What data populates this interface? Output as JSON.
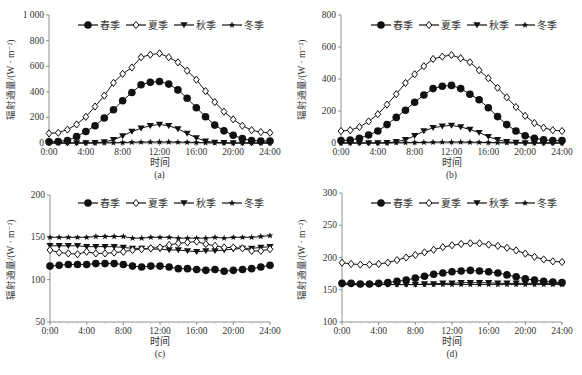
{
  "chart_data": [
    {
      "id": "a",
      "type": "line",
      "panel_label": "(a)",
      "xlabel": "时间",
      "ylabel": "辐射通量/(W · m⁻²)",
      "ylim": [
        0,
        1000
      ],
      "yticks": [
        0,
        200,
        400,
        600,
        800,
        1000
      ],
      "ytick_labels": [
        "0",
        "200",
        "400",
        "600",
        "800",
        "1 000"
      ],
      "xticks": [
        "0:00",
        "4:00",
        "8:00",
        "12:00",
        "16:00",
        "20:00",
        "24:00"
      ],
      "x_hours": [
        0,
        1,
        2,
        3,
        4,
        5,
        6,
        7,
        8,
        9,
        10,
        11,
        12,
        13,
        14,
        15,
        16,
        17,
        18,
        19,
        20,
        21,
        22,
        23,
        24
      ],
      "grid": false,
      "legend_position": "top",
      "series": [
        {
          "name": "春季",
          "marker": "filled-circle",
          "values": [
            10,
            12,
            20,
            50,
            90,
            135,
            195,
            260,
            330,
            395,
            455,
            475,
            480,
            460,
            415,
            350,
            275,
            205,
            140,
            95,
            60,
            35,
            20,
            15,
            15
          ]
        },
        {
          "name": "夏季",
          "marker": "open-diamond",
          "values": [
            75,
            80,
            105,
            145,
            205,
            285,
            370,
            470,
            540,
            590,
            670,
            690,
            700,
            670,
            630,
            565,
            495,
            405,
            320,
            245,
            185,
            135,
            100,
            85,
            80
          ]
        },
        {
          "name": "秋季",
          "marker": "filled-triangle-down",
          "values": [
            0,
            0,
            0,
            0,
            0,
            2,
            8,
            25,
            55,
            90,
            115,
            135,
            145,
            135,
            110,
            75,
            40,
            15,
            5,
            2,
            0,
            0,
            0,
            0,
            0
          ]
        },
        {
          "name": "冬季",
          "marker": "star",
          "values": [
            0,
            0,
            0,
            0,
            0,
            0,
            1,
            2,
            4,
            6,
            7,
            8,
            8,
            8,
            7,
            6,
            4,
            2,
            1,
            0,
            0,
            0,
            0,
            0,
            0
          ]
        }
      ]
    },
    {
      "id": "b",
      "type": "line",
      "panel_label": "(b)",
      "xlabel": "时间",
      "ylabel": "辐射通量/(W · m⁻²)",
      "ylim": [
        0,
        800
      ],
      "yticks": [
        0,
        200,
        400,
        600,
        800
      ],
      "ytick_labels": [
        "0",
        "200",
        "400",
        "600",
        "800"
      ],
      "xticks": [
        "0:00",
        "4:00",
        "8:00",
        "12:00",
        "16:00",
        "20:00",
        "24:00"
      ],
      "x_hours": [
        0,
        1,
        2,
        3,
        4,
        5,
        6,
        7,
        8,
        9,
        10,
        11,
        12,
        13,
        14,
        15,
        16,
        17,
        18,
        19,
        20,
        21,
        22,
        23,
        24
      ],
      "grid": false,
      "legend_position": "top",
      "series": [
        {
          "name": "春季",
          "marker": "filled-circle",
          "values": [
            15,
            18,
            30,
            50,
            75,
            115,
            160,
            205,
            255,
            300,
            340,
            355,
            360,
            340,
            305,
            270,
            220,
            165,
            115,
            75,
            45,
            30,
            20,
            15,
            15
          ]
        },
        {
          "name": "夏季",
          "marker": "open-diamond",
          "values": [
            75,
            80,
            100,
            135,
            180,
            240,
            305,
            375,
            430,
            480,
            525,
            540,
            550,
            530,
            505,
            455,
            405,
            345,
            285,
            225,
            170,
            125,
            95,
            80,
            75
          ]
        },
        {
          "name": "秋季",
          "marker": "filled-triangle-down",
          "values": [
            0,
            0,
            0,
            0,
            0,
            2,
            8,
            20,
            45,
            75,
            95,
            105,
            110,
            100,
            85,
            65,
            40,
            20,
            8,
            3,
            0,
            0,
            0,
            0,
            0
          ]
        },
        {
          "name": "冬季",
          "marker": "star",
          "values": [
            0,
            0,
            0,
            0,
            0,
            0,
            1,
            2,
            3,
            4,
            5,
            6,
            6,
            6,
            5,
            4,
            3,
            2,
            1,
            0,
            0,
            0,
            0,
            0,
            0
          ]
        }
      ]
    },
    {
      "id": "c",
      "type": "line",
      "panel_label": "(c)",
      "xlabel": "时间",
      "ylabel": "辐射通量/(W · m⁻²)",
      "ylim": [
        50,
        200
      ],
      "yticks": [
        50,
        100,
        150,
        200
      ],
      "ytick_labels": [
        "50",
        "100",
        "150",
        "200"
      ],
      "xticks": [
        "0:00",
        "4:00",
        "8:00",
        "12:00",
        "16:00",
        "20:00",
        "24:00"
      ],
      "x_hours": [
        0,
        1,
        2,
        3,
        4,
        5,
        6,
        7,
        8,
        9,
        10,
        11,
        12,
        13,
        14,
        15,
        16,
        17,
        18,
        19,
        20,
        21,
        22,
        23,
        24
      ],
      "grid": false,
      "legend_position": "top",
      "series": [
        {
          "name": "春季",
          "marker": "filled-circle",
          "values": [
            116,
            117,
            118,
            118,
            118,
            119,
            119,
            119,
            118,
            116,
            115,
            116,
            116,
            115,
            113,
            113,
            112,
            111,
            112,
            110,
            111,
            112,
            113,
            115,
            117
          ]
        },
        {
          "name": "夏季",
          "marker": "open-diamond",
          "values": [
            135,
            132,
            131,
            130,
            133,
            131,
            131,
            132,
            133,
            135,
            136,
            137,
            138,
            141,
            143,
            144,
            145,
            142,
            140,
            138,
            138,
            137,
            134,
            134,
            136
          ]
        },
        {
          "name": "秋季",
          "marker": "filled-triangle-down",
          "values": [
            140,
            140,
            140,
            140,
            139,
            139,
            139,
            139,
            138,
            137,
            137,
            136,
            136,
            135,
            135,
            134,
            133,
            134,
            134,
            135,
            136,
            137,
            137,
            138,
            139
          ]
        },
        {
          "name": "冬季",
          "marker": "star",
          "values": [
            150,
            150,
            150,
            150,
            150,
            151,
            151,
            151,
            151,
            149,
            149,
            150,
            150,
            150,
            149,
            149,
            149,
            149,
            150,
            149,
            150,
            150,
            150,
            151,
            152
          ]
        }
      ]
    },
    {
      "id": "d",
      "type": "line",
      "panel_label": "(d)",
      "xlabel": "时间",
      "ylabel": "辐射通量/(W · m⁻²)",
      "ylim": [
        100,
        300
      ],
      "yticks": [
        100,
        150,
        200,
        250,
        300
      ],
      "ytick_labels": [
        "100",
        "150",
        "200",
        "250",
        "300"
      ],
      "xticks": [
        "0:00",
        "4:00",
        "8:00",
        "12:00",
        "16:00",
        "20:00",
        "24:00"
      ],
      "x_hours": [
        0,
        1,
        2,
        3,
        4,
        5,
        6,
        7,
        8,
        9,
        10,
        11,
        12,
        13,
        14,
        15,
        16,
        17,
        18,
        19,
        20,
        21,
        22,
        23,
        24
      ],
      "grid": false,
      "legend_position": "top",
      "series": [
        {
          "name": "春季",
          "marker": "filled-circle",
          "values": [
            160,
            160,
            159,
            159,
            160,
            161,
            163,
            165,
            168,
            171,
            174,
            176,
            178,
            179,
            180,
            179,
            178,
            176,
            173,
            170,
            167,
            165,
            163,
            162,
            161
          ]
        },
        {
          "name": "夏季",
          "marker": "open-diamond",
          "values": [
            192,
            190,
            189,
            189,
            190,
            192,
            196,
            200,
            204,
            208,
            212,
            216,
            219,
            221,
            222,
            222,
            220,
            218,
            215,
            211,
            206,
            201,
            197,
            194,
            193
          ]
        },
        {
          "name": "秋季",
          "marker": "filled-triangle-down",
          "values": [
            158,
            158,
            158,
            158,
            158,
            158,
            158,
            158,
            158,
            159,
            159,
            160,
            160,
            161,
            161,
            161,
            161,
            160,
            160,
            160,
            160,
            160,
            160,
            160,
            160
          ]
        },
        {
          "name": "冬季",
          "marker": "star",
          "values": [
            158,
            158,
            158,
            158,
            158,
            158,
            158,
            158,
            158,
            158,
            158,
            158,
            158,
            158,
            158,
            158,
            158,
            158,
            158,
            158,
            158,
            158,
            158,
            158,
            158
          ]
        }
      ]
    }
  ],
  "legend": {
    "items": [
      "春季",
      "夏季",
      "秋季",
      "冬季"
    ]
  }
}
